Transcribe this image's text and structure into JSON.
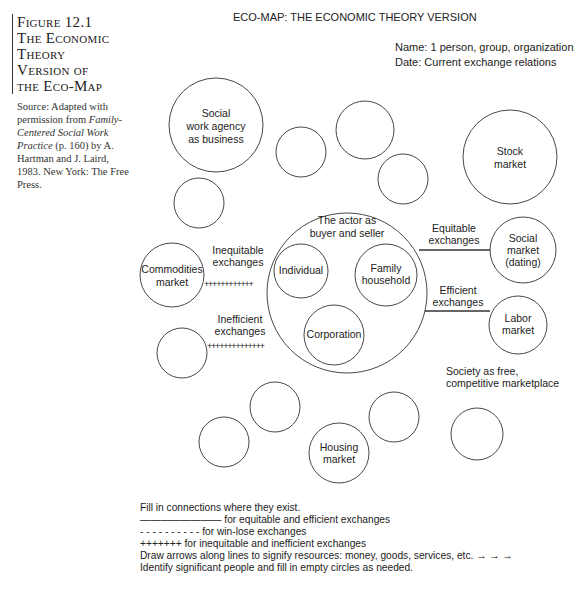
{
  "figure": {
    "title_lines": [
      "Figure 12.1",
      "The Economic",
      "Theory",
      "Version of",
      "the Eco-Map"
    ],
    "source": {
      "prefix": "Source: Adapted with permission from",
      "book_title": "Family-Centered Social Work Practice",
      "suffix": "(p. 160) by A. Hartman and J. Laird, 1983. New York: The Free Press."
    }
  },
  "diagram": {
    "title": "ECO-MAP: THE ECONOMIC THEORY VERSION",
    "name_line": "Name: 1 person, group, organization",
    "date_line": "Date: Current exchange relations",
    "center": {
      "label_lines": [
        "The actor as",
        "buyer and seller"
      ],
      "inner": [
        {
          "label_lines": [
            "Individual"
          ]
        },
        {
          "label_lines": [
            "Family",
            "household"
          ]
        },
        {
          "label_lines": [
            "Corporation"
          ]
        }
      ]
    },
    "nodes": [
      {
        "id": "social-work-agency",
        "label_lines": [
          "Social",
          "work agency",
          "as business"
        ]
      },
      {
        "id": "stock-market",
        "label_lines": [
          "Stock",
          "market"
        ]
      },
      {
        "id": "commodities-market",
        "label_lines": [
          "Commodities",
          "market"
        ]
      },
      {
        "id": "social-market",
        "label_lines": [
          "Social",
          "market",
          "(dating)"
        ]
      },
      {
        "id": "labor-market",
        "label_lines": [
          "Labor",
          "market"
        ]
      },
      {
        "id": "housing-market",
        "label_lines": [
          "Housing",
          "market"
        ]
      }
    ],
    "connections": [
      {
        "label_lines": [
          "Inequitable",
          "exchanges"
        ],
        "style": "plus"
      },
      {
        "label_lines": [
          "Inefficient",
          "exchanges"
        ],
        "style": "plus"
      },
      {
        "label_lines": [
          "Equitable",
          "exchanges"
        ],
        "style": "solid"
      },
      {
        "label_lines": [
          "Efficient",
          "exchanges"
        ],
        "style": "solid"
      }
    ],
    "society_label_lines": [
      "Society as free,",
      "competitive marketplace"
    ]
  },
  "legend": {
    "lines": [
      "Fill in connections where they exist.",
      "———————— for equitable and efficient exchanges",
      "- - - - - - - - - - for win-lose exchanges",
      "+++++++ for inequitable and inefficient exchanges",
      "Draw arrows along lines to signify resources: money, goods, services, etc. →  →  →",
      "Identify significant people and fill in empty circles as needed."
    ]
  }
}
